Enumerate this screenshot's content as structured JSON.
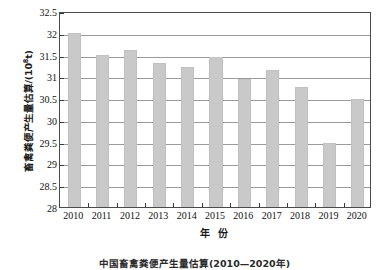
{
  "chart_data": {
    "type": "bar",
    "title": "",
    "categories": [
      "2010",
      "2011",
      "2012",
      "2013",
      "2014",
      "2015",
      "2016",
      "2017",
      "2018",
      "2019",
      "2020"
    ],
    "values": [
      32.0,
      31.5,
      31.6,
      31.31,
      31.22,
      31.44,
      30.94,
      31.14,
      30.76,
      29.47,
      30.49
    ],
    "series": [
      {
        "name": "畜禽粪便产生量估算",
        "values": [
          32.0,
          31.5,
          31.6,
          31.31,
          31.22,
          31.44,
          30.94,
          31.14,
          30.76,
          29.47,
          30.49
        ]
      }
    ],
    "xlabel": "年 份",
    "ylabel": "畜禽粪便产生量估算/(10⁸t)",
    "ylabel_main": "畜禽粪便产生量估算/(10",
    "ylabel_sup": "8",
    "ylabel_tail": "t)",
    "ylim": [
      28,
      32.5
    ],
    "ytick_step": 0.5,
    "yticks": [
      "32.5",
      "32",
      "31.5",
      "31",
      "30.5",
      "30",
      "29.5",
      "29",
      "28.5",
      "28"
    ],
    "ytick_values": [
      32.5,
      32,
      31.5,
      31,
      30.5,
      30,
      29.5,
      29,
      28.5,
      28
    ],
    "grid": true,
    "grid_axis": "y",
    "legend": false,
    "legend_position": "none",
    "bar_color": "#c9c9c9",
    "axis_color": "#4a4a4a",
    "grid_color": "#9b9b9b",
    "caption": "中国畜禽粪便产生量估算(2010—2020年)"
  }
}
